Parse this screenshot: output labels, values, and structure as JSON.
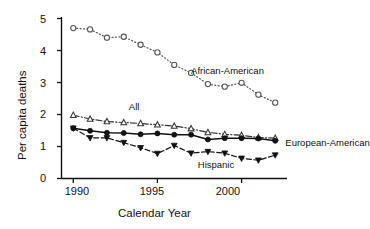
{
  "chart_data": {
    "type": "line",
    "title": "",
    "xlabel": "Calendar  Year",
    "ylabel": "Per capita deaths",
    "xlim": [
      1989.3,
      2002.7
    ],
    "ylim": [
      0,
      5
    ],
    "xticks": [
      1990,
      1995,
      2000
    ],
    "yticks": [
      0,
      1,
      2,
      3,
      4,
      5
    ],
    "grid": false,
    "legend": "inline-annotations",
    "x": [
      1990,
      1991,
      1992,
      1993,
      1994,
      1995,
      1996,
      1997,
      1998,
      1999,
      2000,
      2001,
      2002
    ],
    "series": [
      {
        "name": "African-American",
        "marker": "open-circle",
        "linestyle": "dotted",
        "color": "#555555",
        "values": [
          4.7,
          4.66,
          4.4,
          4.43,
          4.18,
          3.94,
          3.55,
          3.3,
          2.95,
          2.87,
          2.99,
          2.62,
          2.37
        ],
        "label_x": 1997.0,
        "label_y": 3.35
      },
      {
        "name": "All",
        "marker": "open-triangle-up",
        "linestyle": "dash-dot",
        "color": "#333333",
        "values": [
          1.98,
          1.86,
          1.78,
          1.75,
          1.72,
          1.68,
          1.64,
          1.56,
          1.44,
          1.38,
          1.35,
          1.28,
          1.26
        ],
        "label_x": 1993.3,
        "label_y": 2.22
      },
      {
        "name": "European-American",
        "marker": "filled-circle",
        "linestyle": "solid",
        "color": "#111111",
        "values": [
          1.57,
          1.49,
          1.43,
          1.42,
          1.38,
          1.41,
          1.37,
          1.37,
          1.22,
          1.26,
          1.26,
          1.25,
          1.18
        ],
        "label_x": 2002.6,
        "label_y": 1.12
      },
      {
        "name": "Hispanic",
        "marker": "filled-triangle-down",
        "linestyle": "dashed",
        "color": "#111111",
        "values": [
          1.57,
          1.27,
          1.27,
          1.12,
          0.96,
          0.78,
          1.03,
          0.79,
          0.84,
          0.79,
          0.63,
          0.57,
          0.73
        ],
        "label_x": 1997.4,
        "label_y": 0.43
      }
    ]
  },
  "axes": {
    "ylabel": "Per capita deaths",
    "xlabel": "Calendar  Year",
    "yticks": [
      "0",
      "1",
      "2",
      "3",
      "4",
      "5"
    ],
    "xticks": [
      "1990",
      "1995",
      "2000"
    ]
  },
  "annotations": {
    "african_american": "African-American",
    "all": "All",
    "european_american": "European-American",
    "hispanic": "Hispanic"
  }
}
